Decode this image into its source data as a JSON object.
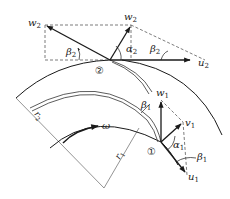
{
  "diagram": {
    "colors": {
      "line": "#1a1a1a",
      "thin": "#555555",
      "dash": "#444444",
      "background": "#ffffff"
    },
    "points": {
      "outlet": {
        "marker": "②"
      },
      "inlet": {
        "marker": "①"
      }
    },
    "outlet_triangle": {
      "w": {
        "base": "w",
        "sub": "2"
      },
      "v": {
        "base": "w",
        "sub": "2"
      },
      "u": {
        "base": "u",
        "sub": "2"
      },
      "angle_beta_left": {
        "base": "β",
        "sub": "2"
      },
      "angle_alpha": {
        "base": "α",
        "sub": "2"
      },
      "angle_beta_right": {
        "base": "β",
        "sub": "2"
      }
    },
    "inlet_triangle": {
      "w": {
        "base": "w",
        "sub": "1"
      },
      "v": {
        "base": "v",
        "sub": "1"
      },
      "u": {
        "base": "u",
        "sub": "1"
      },
      "angle_beta_blade": {
        "base": "β",
        "sub": "1"
      },
      "angle_alpha": {
        "base": "α",
        "sub": "1"
      },
      "angle_beta_lower": {
        "base": "β",
        "sub": "1"
      }
    },
    "radii": {
      "r2": {
        "base": "r",
        "sub": "2"
      },
      "r1": {
        "base": "r",
        "sub": "1"
      }
    },
    "rotation": {
      "base": "ω"
    }
  }
}
